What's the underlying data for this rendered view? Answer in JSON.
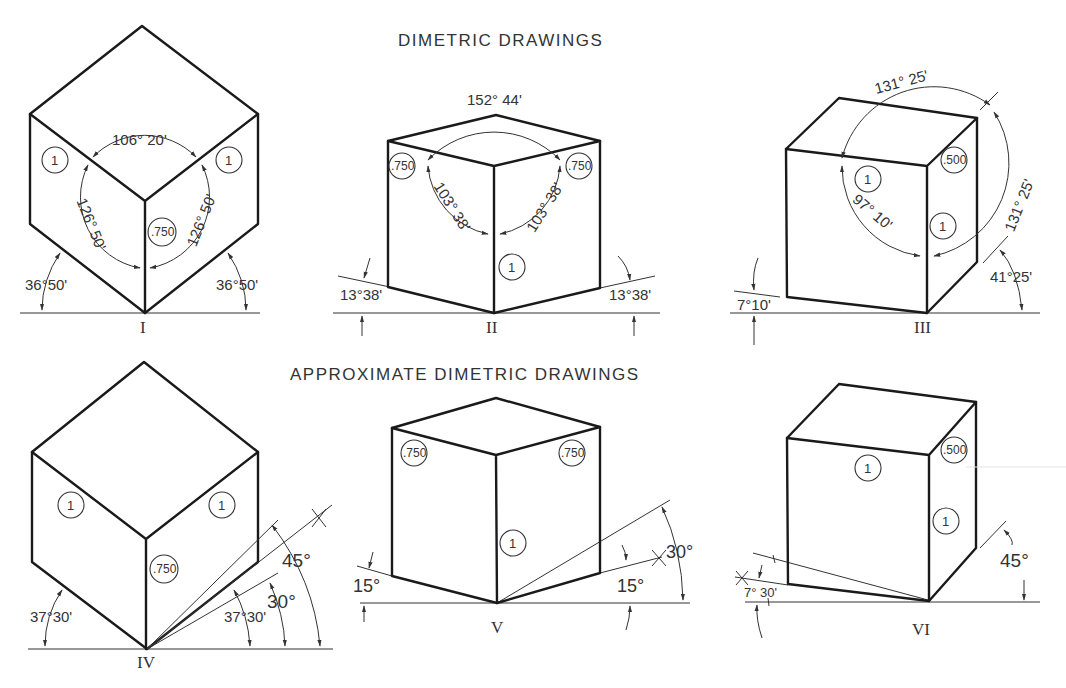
{
  "titles": {
    "top": "DIMETRIC DRAWINGS",
    "bottom": "APPROXIMATE DIMETRIC DRAWINGS"
  },
  "figures": [
    {
      "id": "I",
      "label": "I",
      "top_arc": "106° 20'",
      "left_arc": "126° 50'",
      "right_arc": "126° 50'",
      "left_base_angle": "36°50'",
      "right_base_angle": "36°50'",
      "scales": [
        "1",
        "1",
        ".750"
      ]
    },
    {
      "id": "II",
      "label": "II",
      "top_arc": "152° 44'",
      "left_arc": "103° 38'",
      "right_arc": "103° 38'",
      "left_base_angle": "13°38'",
      "right_base_angle": "13°38'",
      "scales": [
        ".750",
        ".750",
        "1"
      ]
    },
    {
      "id": "III",
      "label": "III",
      "top_arc": "131° 25'",
      "left_arc": "97° 10'",
      "right_arc": "131° 25'",
      "left_base_angle": "7°10'",
      "right_base_angle": "41°25'",
      "scales": [
        "1",
        ".500",
        "1"
      ]
    },
    {
      "id": "IV",
      "label": "IV",
      "left_base_angle": "37°30'",
      "right_base_angle": "37°30'",
      "construction_angles": [
        "30°",
        "45°"
      ],
      "scales": [
        "1",
        "1",
        ".750"
      ]
    },
    {
      "id": "V",
      "label": "V",
      "left_base_angle": "15°",
      "right_base_angle": "15°",
      "construction_angles": [
        "30°"
      ],
      "scales": [
        ".750",
        ".750",
        "1"
      ]
    },
    {
      "id": "VI",
      "label": "VI",
      "left_base_angle": "7° 30'",
      "right_base_angle": "45°",
      "scales": [
        "1",
        ".500",
        "1"
      ]
    }
  ]
}
